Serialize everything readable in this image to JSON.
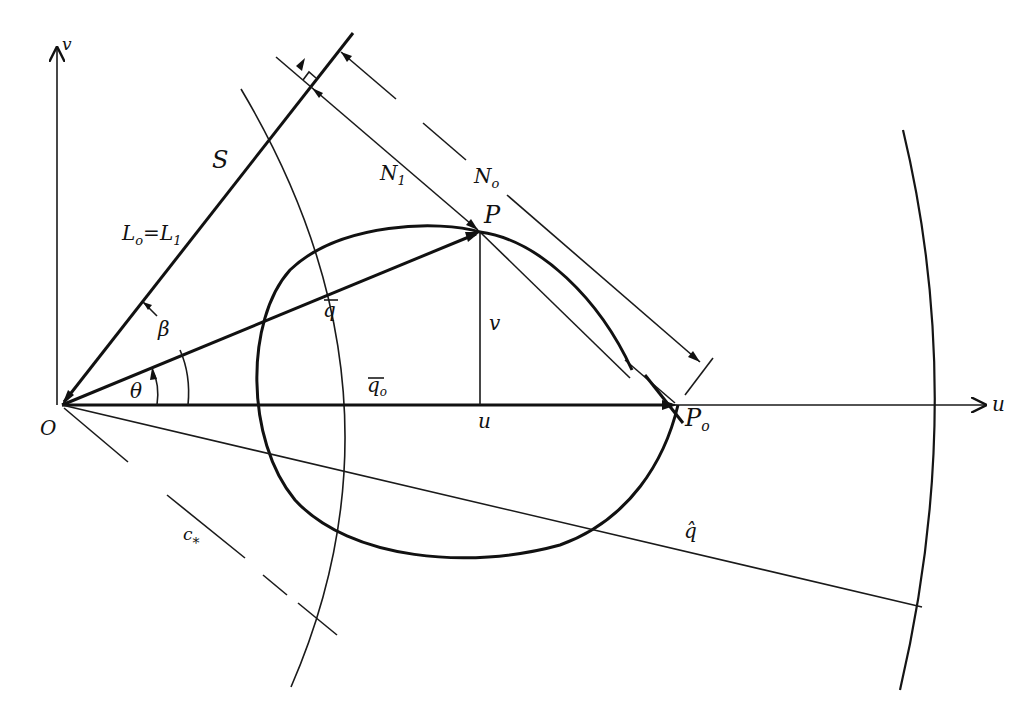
{
  "figure": {
    "colors": {
      "ink": "#111111",
      "paper": "#ffffff"
    }
  },
  "axes": {
    "u_label": "u",
    "v_label": "v"
  },
  "points": {
    "origin_label": "O",
    "P_label": "P",
    "P0_label": "P",
    "P0_subscript": "o"
  },
  "labels": {
    "S": "S",
    "L_eq": "L",
    "L0_sub": "o",
    "L_equals": "=",
    "L1": "L",
    "L1_sub": "1",
    "N1": "N",
    "N1_sub": "1",
    "N0": "N",
    "N0_sub": "o",
    "beta": "β",
    "theta": "θ",
    "q_vec": "q",
    "q0_vec": "q",
    "q0_sub": "o",
    "v_component": "v",
    "u_component": "u",
    "q_hat": "q̂",
    "c_star": "c",
    "c_star_sub": "*"
  }
}
